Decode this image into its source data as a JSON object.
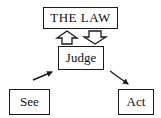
{
  "diagram": {
    "nodes": {
      "law": {
        "label": "THE LAW"
      },
      "judge": {
        "label": "Judge"
      },
      "see": {
        "label": "See"
      },
      "act": {
        "label": "Act"
      }
    },
    "edges": [
      {
        "from": "see",
        "to": "judge",
        "style": "solid-arrow"
      },
      {
        "from": "judge",
        "to": "act",
        "style": "solid-arrow"
      },
      {
        "from": "judge",
        "to": "law",
        "style": "hollow-block-arrow-up"
      },
      {
        "from": "law",
        "to": "judge",
        "style": "hollow-block-arrow-down"
      }
    ],
    "colors": {
      "stroke": "#1a1a1a",
      "background": "#ffffff"
    }
  }
}
